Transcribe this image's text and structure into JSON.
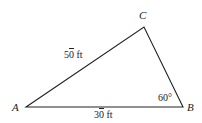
{
  "diagram": {
    "type": "triangle",
    "vertices": {
      "A": {
        "label": "A",
        "x": 26,
        "y": 107
      },
      "B": {
        "label": "B",
        "x": 183,
        "y": 107
      },
      "C": {
        "label": "C",
        "x": 144,
        "y": 27
      }
    },
    "sides": {
      "AC": {
        "digits_main": "5",
        "digits_bar": "0",
        "unit": " ft",
        "text": "50̄ ft"
      },
      "AB": {
        "digits_main": "3",
        "digits_bar": "0",
        "unit": " ft",
        "text": "30̄ ft"
      }
    },
    "angles": {
      "B": {
        "value": "60°"
      }
    },
    "colors": {
      "stroke": "#222222",
      "text": "#222222",
      "background": "#ffffff"
    }
  }
}
